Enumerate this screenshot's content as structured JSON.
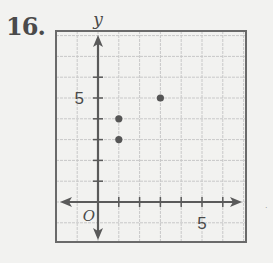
{
  "problem_number": "16.",
  "chart_data": {
    "type": "scatter",
    "title": "",
    "xlabel": "",
    "ylabel": "y",
    "origin_label": "O",
    "x_tick_label": "5",
    "y_tick_label": "5",
    "xlim": [
      -2,
      7
    ],
    "ylim": [
      -2,
      8
    ],
    "grid": true,
    "points": [
      {
        "x": 1,
        "y": 3
      },
      {
        "x": 1,
        "y": 4
      },
      {
        "x": 3,
        "y": 5
      }
    ]
  },
  "colors": {
    "background": "#f2f2f0",
    "grid_line": "#c8c8c8",
    "axis": "#5a5a5a",
    "border": "#6a6a6a",
    "point": "#555555",
    "text": "#4a4a4a"
  }
}
